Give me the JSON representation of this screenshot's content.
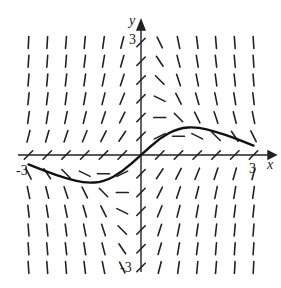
{
  "figure": {
    "type": "slope_field",
    "x_axis_label": "x",
    "y_axis_label": "y",
    "tick_labels": {
      "x_neg": "-3",
      "x_pos": "3",
      "y_pos": "3",
      "y_neg": "-3"
    },
    "x_range": [
      -3,
      3
    ],
    "y_range": [
      -3,
      3
    ],
    "grid_step": 0.5,
    "stroke_color": "#222222",
    "solution_curve": {
      "description": "particular solution through origin; S-shaped, max near x=1 (y≈0.8), min near x=-1 (y≈-0.8), approaches 0 toward x=±3",
      "points": [
        [
          -3,
          -0.25
        ],
        [
          -2.5,
          -0.45
        ],
        [
          -2,
          -0.62
        ],
        [
          -1.5,
          -0.75
        ],
        [
          -1,
          -0.72
        ],
        [
          -0.5,
          -0.45
        ],
        [
          0,
          0
        ],
        [
          0.5,
          0.45
        ],
        [
          1,
          0.72
        ],
        [
          1.5,
          0.75
        ],
        [
          2,
          0.62
        ],
        [
          2.5,
          0.45
        ],
        [
          3,
          0.25
        ]
      ]
    }
  }
}
